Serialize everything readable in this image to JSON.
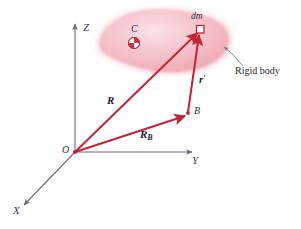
{
  "figure": {
    "background_color": "#ffffff"
  },
  "axes": {
    "x_label": "X",
    "y_label": "Y",
    "z_label": "Z",
    "origin_label": "O",
    "axis_color": "#6b6b80"
  },
  "body": {
    "annotation_label": "Rigid body",
    "center_of_mass_label": "C",
    "mass_element_label": "dm",
    "point_b_label": "B",
    "fill_color": "#f3b9c1",
    "edge_color": "#f6cdd3"
  },
  "vectors": {
    "color": "#c42436",
    "r_label": "R",
    "rb_label": "R",
    "rb_subscript": "B",
    "rprime_label": "r",
    "rprime_prime": "′"
  },
  "annotations": {
    "leader_color": "#7a7a88"
  }
}
